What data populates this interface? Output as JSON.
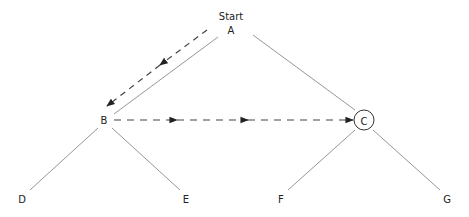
{
  "diagram": {
    "type": "tree-traversal",
    "start_label": "Start",
    "nodes": [
      {
        "id": "A",
        "label": "A",
        "x": 231,
        "y": 30
      },
      {
        "id": "B",
        "label": "B",
        "x": 104,
        "y": 120
      },
      {
        "id": "C",
        "label": "C",
        "x": 364,
        "y": 120,
        "circled": true
      },
      {
        "id": "D",
        "label": "D",
        "x": 22,
        "y": 199
      },
      {
        "id": "E",
        "label": "E",
        "x": 186,
        "y": 199
      },
      {
        "id": "F",
        "label": "F",
        "x": 281,
        "y": 199
      },
      {
        "id": "G",
        "label": "G",
        "x": 447,
        "y": 199
      }
    ],
    "edges": [
      {
        "from": "A",
        "to": "B"
      },
      {
        "from": "A",
        "to": "C"
      },
      {
        "from": "B",
        "to": "D"
      },
      {
        "from": "B",
        "to": "E"
      },
      {
        "from": "C",
        "to": "F"
      },
      {
        "from": "C",
        "to": "G"
      }
    ],
    "traversal_path": [
      {
        "from": "A",
        "to": "B",
        "style": "dashed-arrow"
      },
      {
        "from": "B",
        "to": "C",
        "style": "dashed-arrow"
      }
    ]
  }
}
